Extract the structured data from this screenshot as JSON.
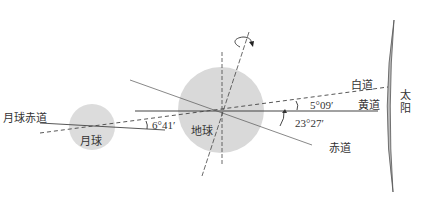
{
  "diagram": {
    "colors": {
      "body_fill": "#d9d9d9",
      "line": "#444444",
      "text": "#333333",
      "sun_fill": "#bdbdbd"
    },
    "labels": {
      "moon": "月球",
      "earth": "地球",
      "sun": "太阳",
      "sun_line1": "太",
      "sun_line2": "阳",
      "moon_equator": "月球赤道",
      "white_path": "白道",
      "ecliptic": "黄道",
      "celestial_equator": "赤道"
    },
    "angles": {
      "moon_equator_to_white_path": "6°41′",
      "white_path_to_ecliptic": "5°09′",
      "equator_to_ecliptic": "23°27′"
    },
    "icons": {
      "rotation": "rotation-arrow-icon"
    }
  }
}
